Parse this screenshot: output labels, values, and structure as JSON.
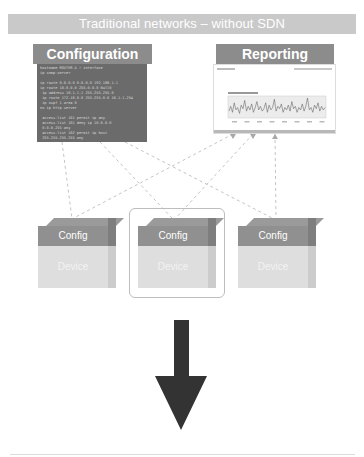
{
  "title": "Traditional networks – without SDN",
  "configuration": {
    "label": "Configuration",
    "terminal_lines": [
      "hostname ROUTER-A ! interface",
      "ip snmp-server",
      "",
      "ip route 0.0.0.0 0.0.0.0 192.168.1.1",
      "ip route 10.0.0.0 255.0.0.0 Null0",
      " ip address 10.1.1.1 255.255.255.0",
      " ip route 172.16.0.0 255.255.0.0 10.1.1.254",
      " ip ospf 1 area 0",
      "no ip http server",
      "",
      " access-list 101 permit ip any",
      " access-list 101 deny ip 10.0.0.0",
      " 0.0.0.255 any",
      " access-list 102 permit ip host",
      " 255.255.255.255 any"
    ]
  },
  "reporting": {
    "label": "Reporting",
    "chart_values": [
      5,
      9,
      4,
      12,
      6,
      8,
      3,
      10,
      7,
      14,
      5,
      9,
      6,
      11,
      4,
      8,
      13,
      6,
      9,
      5,
      7,
      12,
      4,
      10,
      6,
      8,
      15,
      5,
      9,
      7,
      11,
      4,
      8,
      6,
      10,
      5,
      13,
      7,
      9,
      4,
      8,
      6,
      11,
      5,
      9,
      16,
      6,
      8,
      4,
      10,
      7,
      12,
      5,
      9,
      6,
      8
    ]
  },
  "devices": [
    {
      "config_label": "Config",
      "device_label": "Device",
      "highlighted": false
    },
    {
      "config_label": "Config",
      "device_label": "Device",
      "highlighted": true
    },
    {
      "config_label": "Config",
      "device_label": "Device",
      "highlighted": false
    }
  ],
  "arrow": {
    "direction": "down",
    "color": "#333333"
  },
  "colors": {
    "title_bg": "#c9c9c9",
    "header_bg": "#8c8c8c",
    "terminal_bg": "#6b6b6b",
    "config_face": "#909090",
    "device_face": "#dedede",
    "connector": "#c4c4c4"
  }
}
